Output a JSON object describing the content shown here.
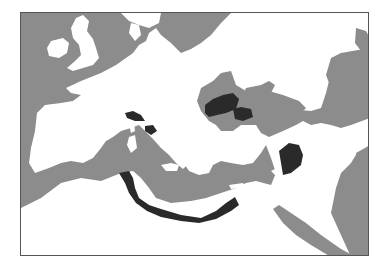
{
  "map": {
    "type": "historical-region-map",
    "area": "Mediterranean and Europe",
    "colors": {
      "sea": "#8c8c8c",
      "land": "#ffffff",
      "highlighted_region": "#2a2a2a",
      "frame": "#555555"
    },
    "highlighted_regions": [
      "Ligurian coast",
      "Central Italy (Latium/Campania)",
      "Thrace and northern Aegean coast",
      "Bithynia / Propontis",
      "Cilicia / northern Levant",
      "Libya / Cyrenaica coast",
      "Tunisia coast"
    ]
  }
}
